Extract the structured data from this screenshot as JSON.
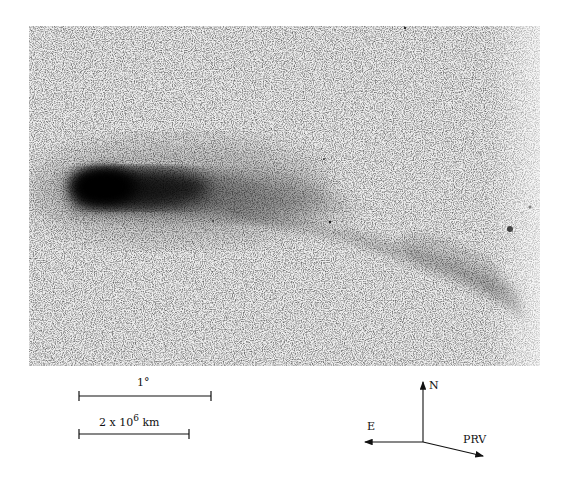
{
  "figure": {
    "image_description": "Comet photograph (negative print) showing dark coma at left and tail extending right with disconnected ion tail structure",
    "scale_bars": [
      {
        "label": "1°",
        "length_px": 132
      },
      {
        "label_base": "2 x 10",
        "label_exp": "6",
        "label_unit": "km",
        "length_px": 110
      }
    ],
    "compass": {
      "north": "N",
      "east": "E",
      "prv": "PRV"
    },
    "colors": {
      "background": "#ffffff",
      "sky": "#efefef",
      "coma": "#050505",
      "ink": "#111111"
    }
  }
}
